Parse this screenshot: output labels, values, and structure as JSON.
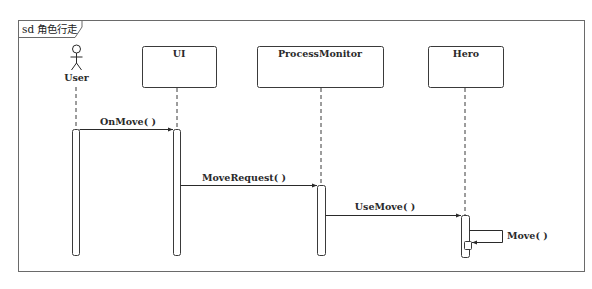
{
  "frame": {
    "label": "sd 角色行走"
  },
  "lifelines": [
    {
      "name": "User",
      "kind": "actor"
    },
    {
      "name": "UI",
      "kind": "object"
    },
    {
      "name": "ProcessMonitor",
      "kind": "object"
    },
    {
      "name": "Hero",
      "kind": "object"
    }
  ],
  "messages": [
    {
      "label": "OnMove( )",
      "from": "User",
      "to": "UI"
    },
    {
      "label": "MoveRequest( )",
      "from": "UI",
      "to": "ProcessMonitor"
    },
    {
      "label": "UseMove( )",
      "from": "ProcessMonitor",
      "to": "Hero"
    },
    {
      "label": "Move( )",
      "from": "Hero",
      "to": "Hero"
    }
  ],
  "colors": {
    "stroke": "#3a3a3a",
    "frame": "#6a6a6a",
    "background": "#ffffff"
  }
}
